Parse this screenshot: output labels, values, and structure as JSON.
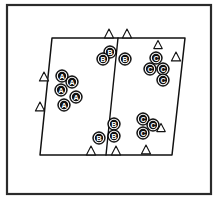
{
  "figure": {
    "title": "",
    "background_color": "#ffffff",
    "ink_color": "#111111",
    "frame_color": "#2b2b2b",
    "marker_fill": "#111111",
    "marker_text_color": "#ffffff",
    "triangle_fill": "#ffffff"
  },
  "frame": {
    "x": 7,
    "y": 5,
    "width": 204,
    "height": 189
  },
  "parallelogram": {
    "points": "52,38 185,38 172,155 40,155",
    "corners": {
      "top_left": [
        52,
        38
      ],
      "top_right": [
        185,
        38
      ],
      "bottom_right": [
        172,
        155
      ],
      "bottom_left": [
        40,
        155
      ]
    }
  },
  "divider": {
    "from": [
      118,
      38
    ],
    "to": [
      106,
      155
    ]
  },
  "markers": [
    {
      "label": "A",
      "x": 62,
      "y": 76,
      "r": 6.2,
      "cluster": "A-left-cell"
    },
    {
      "label": "A",
      "x": 72,
      "y": 82,
      "r": 6.2,
      "cluster": "A-left-cell"
    },
    {
      "label": "A",
      "x": 61,
      "y": 90,
      "r": 6.2,
      "cluster": "A-left-cell"
    },
    {
      "label": "A",
      "x": 76,
      "y": 97,
      "r": 6.2,
      "cluster": "A-left-cell"
    },
    {
      "label": "A",
      "x": 64,
      "y": 105,
      "r": 6.2,
      "cluster": "A-left-cell"
    },
    {
      "label": "B",
      "x": 110,
      "y": 52,
      "r": 6.2,
      "cluster": "B-top"
    },
    {
      "label": "B",
      "x": 103,
      "y": 59,
      "r": 6.2,
      "cluster": "B-top"
    },
    {
      "label": "B",
      "x": 125,
      "y": 59,
      "r": 6.2,
      "cluster": "B-top"
    },
    {
      "label": "B",
      "x": 114,
      "y": 124,
      "r": 6.2,
      "cluster": "B-bottom"
    },
    {
      "label": "B",
      "x": 114,
      "y": 136,
      "r": 6.2,
      "cluster": "B-bottom"
    },
    {
      "label": "B",
      "x": 99,
      "y": 138,
      "r": 6.2,
      "cluster": "B-bottom"
    },
    {
      "label": "C",
      "x": 156,
      "y": 58,
      "r": 6.2,
      "cluster": "C-top-right"
    },
    {
      "label": "C",
      "x": 150,
      "y": 69,
      "r": 6.2,
      "cluster": "C-top-right"
    },
    {
      "label": "C",
      "x": 163,
      "y": 69,
      "r": 6.2,
      "cluster": "C-top-right"
    },
    {
      "label": "C",
      "x": 163,
      "y": 80,
      "r": 6.2,
      "cluster": "C-top-right"
    },
    {
      "label": "C",
      "x": 143,
      "y": 119,
      "r": 6.2,
      "cluster": "C-bottom-right"
    },
    {
      "label": "C",
      "x": 153,
      "y": 125,
      "r": 6.2,
      "cluster": "C-bottom-right"
    },
    {
      "label": "C",
      "x": 143,
      "y": 133,
      "r": 6.2,
      "cluster": "C-bottom-right"
    }
  ],
  "triangles": [
    {
      "x": 44,
      "y": 77,
      "size": 5.0,
      "region": "left-edge"
    },
    {
      "x": 40,
      "y": 107,
      "size": 5.0,
      "region": "left-edge"
    },
    {
      "x": 109,
      "y": 34,
      "size": 5.0,
      "region": "top-edge"
    },
    {
      "x": 127,
      "y": 34,
      "size": 5.0,
      "region": "top-edge"
    },
    {
      "x": 158,
      "y": 45,
      "size": 4.6,
      "region": "inside-right"
    },
    {
      "x": 176,
      "y": 57,
      "size": 5.0,
      "region": "right-edge"
    },
    {
      "x": 161,
      "y": 128,
      "size": 4.6,
      "region": "inside-right"
    },
    {
      "x": 91,
      "y": 151,
      "size": 5.0,
      "region": "bottom-edge"
    },
    {
      "x": 116,
      "y": 151,
      "size": 5.0,
      "region": "bottom-edge"
    },
    {
      "x": 146,
      "y": 150,
      "size": 5.0,
      "region": "bottom-edge"
    }
  ]
}
